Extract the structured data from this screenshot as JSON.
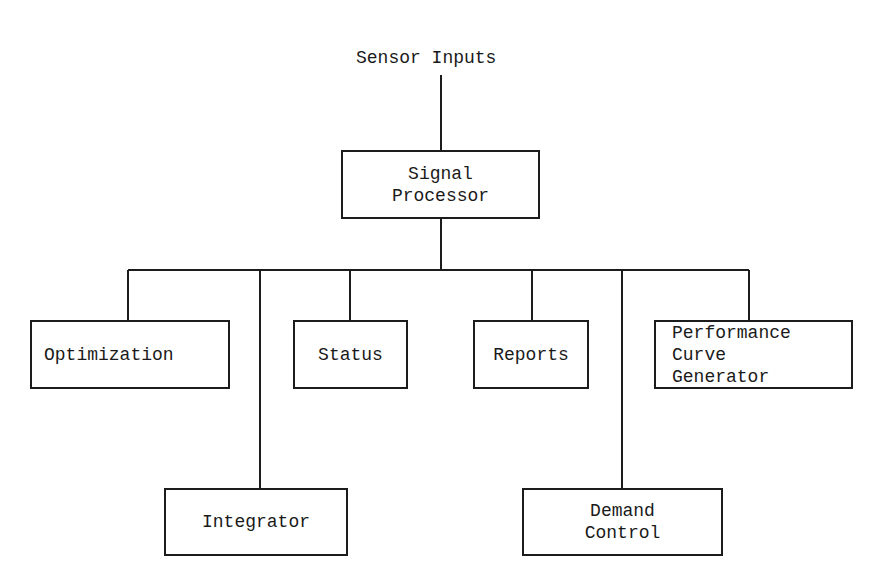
{
  "diagram": {
    "type": "hierarchy",
    "input_label": "Sensor Inputs",
    "root": {
      "id": "signal-processor",
      "label": "Signal\nProcessor"
    },
    "children": [
      {
        "id": "optimization",
        "label": "Optimization",
        "row": 1
      },
      {
        "id": "integrator",
        "label": "Integrator",
        "row": 2
      },
      {
        "id": "status",
        "label": "Status",
        "row": 1
      },
      {
        "id": "reports",
        "label": "Reports",
        "row": 1
      },
      {
        "id": "demand-control",
        "label": "Demand\nControl",
        "row": 2
      },
      {
        "id": "performance-curve-generator",
        "label": "Performance\n Curve\nGenerator",
        "row": 1
      }
    ],
    "edges": [
      [
        "Sensor Inputs",
        "Signal Processor"
      ],
      [
        "Signal Processor",
        "Optimization"
      ],
      [
        "Signal Processor",
        "Integrator"
      ],
      [
        "Signal Processor",
        "Status"
      ],
      [
        "Signal Processor",
        "Reports"
      ],
      [
        "Signal Processor",
        "Demand Control"
      ],
      [
        "Signal Processor",
        "Performance Curve Generator"
      ]
    ],
    "line_color": "#1c1c1c"
  }
}
